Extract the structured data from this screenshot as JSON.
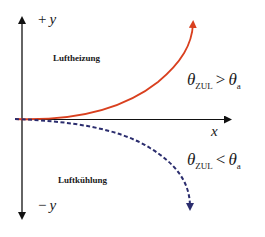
{
  "diagram": {
    "axes": {
      "y_positive": {
        "sign": "+",
        "var": "y"
      },
      "y_negative": {
        "sign": "−",
        "var": "y"
      },
      "x": {
        "var": "x"
      }
    },
    "regions": {
      "upper": "Luftheizung",
      "lower": "Luftkühlung"
    },
    "curves": [
      {
        "name": "heating-curve",
        "color": "#d9401f",
        "style": "solid",
        "direction": "up-right"
      },
      {
        "name": "cooling-curve",
        "color": "#2b2d6e",
        "style": "dashed",
        "direction": "down-right"
      }
    ],
    "conditions": {
      "upper": {
        "lhs": "θ",
        "lhs_sub": "ZUL",
        "op": ">",
        "rhs": "θ",
        "rhs_sub": "a"
      },
      "lower": {
        "lhs": "θ",
        "lhs_sub": "ZUL",
        "op": "<",
        "rhs": "θ",
        "rhs_sub": "a"
      }
    }
  }
}
